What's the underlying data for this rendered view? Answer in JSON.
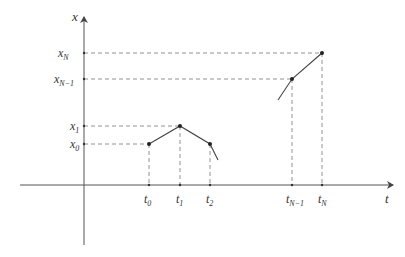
{
  "diagram": {
    "axes": {
      "y_label": "x",
      "x_label": "t"
    },
    "y_ticks": [
      {
        "main": "x",
        "sub": "N",
        "y": 53
      },
      {
        "main": "x",
        "sub": "N−1",
        "y": 79
      },
      {
        "main": "x",
        "sub": "1",
        "y": 126
      },
      {
        "main": "x",
        "sub": "0",
        "y": 144
      }
    ],
    "x_ticks": [
      {
        "main": "t",
        "sub": "0",
        "x": 149
      },
      {
        "main": "t",
        "sub": "1",
        "x": 180
      },
      {
        "main": "t",
        "sub": "2",
        "x": 210
      },
      {
        "main": "t",
        "sub": "N−1",
        "x": 292
      },
      {
        "main": "t",
        "sub": "N",
        "x": 322
      }
    ],
    "points": [
      {
        "name": "(t0,x0)",
        "x": 149,
        "y": 144
      },
      {
        "name": "(t1,x1)",
        "x": 180,
        "y": 126
      },
      {
        "name": "(t2,x0)",
        "x": 210,
        "y": 144
      },
      {
        "name": "(tN-1,xN-1)",
        "x": 292,
        "y": 79
      },
      {
        "name": "(tN,xN)",
        "x": 322,
        "y": 53
      }
    ],
    "colors": {
      "line": "#444444",
      "dashed": "#777777"
    }
  }
}
